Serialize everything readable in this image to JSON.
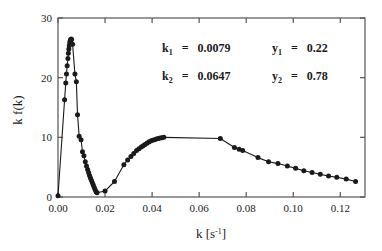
{
  "chart_data": {
    "type": "line",
    "title": "",
    "xlabel": "k [s-1]",
    "xlabel_base": "k [s",
    "xlabel_exp": "-1",
    "xlabel_close": "]",
    "ylabel": "k f(k)",
    "xlim": [
      0.0,
      0.1305
    ],
    "ylim": [
      0,
      30
    ],
    "xticks": [
      "0.00",
      "0.02",
      "0.04",
      "0.06",
      "0.08",
      "0.10",
      "0.12"
    ],
    "xtick_values": [
      0.0,
      0.02,
      0.04,
      0.06,
      0.08,
      0.1,
      0.12
    ],
    "yticks": [
      "0",
      "10",
      "20",
      "30"
    ],
    "ytick_values": [
      0,
      10,
      20,
      30
    ],
    "grid": false,
    "legend": "none",
    "marker": "filled-circle",
    "series": [
      {
        "name": "k f(k)",
        "x": [
          0.0,
          0.0028,
          0.0033,
          0.0036,
          0.0039,
          0.0042,
          0.0044,
          0.0046,
          0.0048,
          0.005,
          0.0052,
          0.0054,
          0.0056,
          0.0058,
          0.0062,
          0.0072,
          0.0078,
          0.0083,
          0.009,
          0.0098,
          0.0104,
          0.011,
          0.0116,
          0.0121,
          0.0126,
          0.013,
          0.0134,
          0.0138,
          0.0142,
          0.0146,
          0.015,
          0.0154,
          0.0158,
          0.0162,
          0.0166,
          0.02,
          0.024,
          0.028,
          0.0296,
          0.031,
          0.0322,
          0.0334,
          0.0344,
          0.0354,
          0.0362,
          0.037,
          0.0378,
          0.0386,
          0.0394,
          0.0402,
          0.041,
          0.0418,
          0.0426,
          0.0434,
          0.0442,
          0.045,
          0.069,
          0.075,
          0.077,
          0.0785,
          0.085,
          0.0895,
          0.0935,
          0.0975,
          0.101,
          0.1045,
          0.108,
          0.1115,
          0.115,
          0.1185,
          0.1225,
          0.1265
        ],
        "y": [
          0.2,
          16.3,
          19.1,
          20.6,
          22.0,
          23.2,
          24.1,
          24.8,
          25.4,
          25.9,
          26.2,
          26.4,
          26.5,
          26.4,
          25.6,
          20.6,
          19.3,
          13.8,
          10.2,
          9.6,
          7.6,
          6.9,
          5.9,
          5.2,
          4.6,
          4.1,
          3.6,
          3.2,
          2.8,
          2.4,
          2.0,
          1.6,
          1.2,
          0.9,
          0.7,
          1.0,
          2.6,
          5.4,
          6.2,
          6.8,
          7.3,
          7.8,
          8.1,
          8.4,
          8.6,
          8.8,
          9.0,
          9.2,
          9.4,
          9.5,
          9.6,
          9.7,
          9.8,
          9.9,
          9.95,
          10.0,
          9.8,
          8.3,
          8.0,
          7.8,
          6.6,
          5.9,
          5.6,
          5.2,
          4.8,
          4.4,
          4.1,
          3.8,
          3.5,
          3.3,
          3.0,
          2.6
        ]
      }
    ],
    "annotations": [
      {
        "label": "k",
        "subscript": "1",
        "equals": "=",
        "value": "0.0079"
      },
      {
        "label": "y",
        "subscript": "1",
        "equals": "=",
        "value": "0.22"
      },
      {
        "label": "k",
        "subscript": "2",
        "equals": "=",
        "value": "0.0647"
      },
      {
        "label": "y",
        "subscript": "2",
        "equals": "=",
        "value": "0.78"
      }
    ],
    "colors": {
      "line": "#1a1a1a",
      "marker": "#1a1a1a",
      "axis": "#555555",
      "background": "#ffffff"
    }
  }
}
